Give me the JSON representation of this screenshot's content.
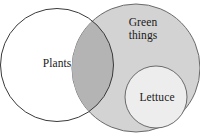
{
  "figure": {
    "type": "venn-diagram",
    "background_color": "#ffffff",
    "width": 200,
    "height": 139
  },
  "sets": {
    "plants": {
      "label": "Plants",
      "fill_color": "#ffffff",
      "stroke_color": "#3a3a3a",
      "cx": 57,
      "cy": 65,
      "r": 56.5
    },
    "green_things": {
      "label": "Green\nthings",
      "fill_color": "#d3d3d3",
      "stroke_color": "#6a6a6a",
      "cx": 136,
      "cy": 68,
      "r": 64
    },
    "lettuce": {
      "label": "Lettuce",
      "fill_color": "#ededed",
      "stroke_color": "#6a6a6a",
      "cx": 156,
      "cy": 97,
      "r": 31
    }
  },
  "regions": {
    "intersection": {
      "name": "plants-and-green-things",
      "fill_color": "#b4b4b4"
    }
  },
  "text_color": "#1a1a1a"
}
